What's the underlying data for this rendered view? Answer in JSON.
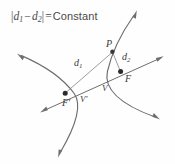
{
  "figure": {
    "kind": "geometry-diagram",
    "background_color": "#fefefe",
    "curve_color": "#6e6e6e",
    "label_color": "#3b3b3b",
    "dot_color": "#2b2b2b",
    "title": {
      "abs_open": "|",
      "d1": "d",
      "d1_sub": "1",
      "minus": "−",
      "d2": "d",
      "d2_sub": "2",
      "abs_close": "|",
      "equals": "=",
      "constant": "Constant",
      "plain": "|d1 − d2| = Constant"
    },
    "labels": {
      "point_p": "P",
      "distance_1": "d",
      "distance_1_sub": "1",
      "distance_2": "d",
      "distance_2_sub": "2",
      "focus": "F",
      "focus_prime": "F′",
      "vertex": "V",
      "vertex_prime": "V′"
    },
    "points": {
      "p": {
        "x": 112.5,
        "y": 51.5
      },
      "focus": {
        "x": 120.5,
        "y": 71.5
      },
      "focus_p": {
        "x": 65.0,
        "y": 93.0
      },
      "vertex": {
        "x": 105.0,
        "y": 81.0
      },
      "vertex_p": {
        "x": 77.5,
        "y": 96.5
      }
    },
    "geometry": {
      "left_branch": "M 18,54 C 40,63 62,77 74,93 C 84,106 74,130 59,156",
      "right_branch": "M 136,11 C 122,31 112,50 107,72 C 103,92 123,107 159,119",
      "transverse_axis": "M 41,112 L 163,57",
      "segment_d1": "M 112.5,51.5 L 65,93",
      "segment_d2": "M 112.5,51.5 L 120.5,71.5",
      "arrow_tips": [
        {
          "name": "left-branch-upper",
          "x": 18,
          "y": 54
        },
        {
          "name": "left-branch-lower",
          "x": 59,
          "y": 156
        },
        {
          "name": "right-branch-upper",
          "x": 136,
          "y": 11
        },
        {
          "name": "right-branch-lower",
          "x": 159,
          "y": 119
        },
        {
          "name": "axis-lower-left",
          "x": 41,
          "y": 112
        },
        {
          "name": "axis-upper-right",
          "x": 163,
          "y": 57
        }
      ]
    }
  }
}
